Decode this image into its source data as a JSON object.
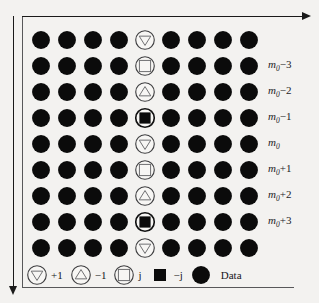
{
  "figure": {
    "name": "pilot-symbol-grid",
    "grid": {
      "columns": 9,
      "rows": 9,
      "pilot_column_index": 4,
      "cells": [
        [
          "data",
          "data",
          "data",
          "data",
          "plus1",
          "data",
          "data",
          "data",
          "data"
        ],
        [
          "data",
          "data",
          "data",
          "data",
          "j",
          "data",
          "data",
          "data",
          "data"
        ],
        [
          "data",
          "data",
          "data",
          "data",
          "minus1",
          "data",
          "data",
          "data",
          "data"
        ],
        [
          "data",
          "data",
          "data",
          "data",
          "minusj",
          "data",
          "data",
          "data",
          "data"
        ],
        [
          "data",
          "data",
          "data",
          "data",
          "plus1",
          "data",
          "data",
          "data",
          "data"
        ],
        [
          "data",
          "data",
          "data",
          "data",
          "j",
          "data",
          "data",
          "data",
          "data"
        ],
        [
          "data",
          "data",
          "data",
          "data",
          "minus1",
          "data",
          "data",
          "data",
          "data"
        ],
        [
          "data",
          "data",
          "data",
          "data",
          "minusj",
          "data",
          "data",
          "data",
          "data"
        ],
        [
          "data",
          "data",
          "data",
          "data",
          "plus1",
          "data",
          "data",
          "data",
          "data"
        ]
      ]
    },
    "row_labels": [
      {
        "row": 0,
        "text": "",
        "base": "",
        "sub": "",
        "op": ""
      },
      {
        "row": 1,
        "text": "m0-3",
        "base": "m",
        "sub": "0",
        "op": "−3"
      },
      {
        "row": 2,
        "text": "m0-2",
        "base": "m",
        "sub": "0",
        "op": "−2"
      },
      {
        "row": 3,
        "text": "m0-1",
        "base": "m",
        "sub": "0",
        "op": "−1"
      },
      {
        "row": 4,
        "text": "m0",
        "base": "m",
        "sub": "0",
        "op": ""
      },
      {
        "row": 5,
        "text": "m0+1",
        "base": "m",
        "sub": "0",
        "op": "+1"
      },
      {
        "row": 6,
        "text": "m0+2",
        "base": "m",
        "sub": "0",
        "op": "+2"
      },
      {
        "row": 7,
        "text": "m0+3",
        "base": "m",
        "sub": "0",
        "op": "+3"
      },
      {
        "row": 8,
        "text": "",
        "base": "",
        "sub": "",
        "op": ""
      }
    ],
    "legend": {
      "items": [
        {
          "symbol": "plus1",
          "label": "+1"
        },
        {
          "symbol": "minus1",
          "label": "−1"
        },
        {
          "symbol": "j",
          "label": "j"
        },
        {
          "symbol": "minusj",
          "label": "−j"
        },
        {
          "symbol": "data",
          "label": "Data"
        }
      ]
    },
    "axes": {
      "horizontal_arrow": "arrow-right",
      "vertical_arrow": "arrow-down"
    },
    "colors": {
      "data_fill": "#0b0b0b",
      "ring_stroke": "#3f3f41",
      "ring_fill": "#f7f6f4",
      "axis": "#1a1a1a",
      "frame": "#58585a",
      "background": "#f3f2f0",
      "text": "#16161a"
    }
  }
}
